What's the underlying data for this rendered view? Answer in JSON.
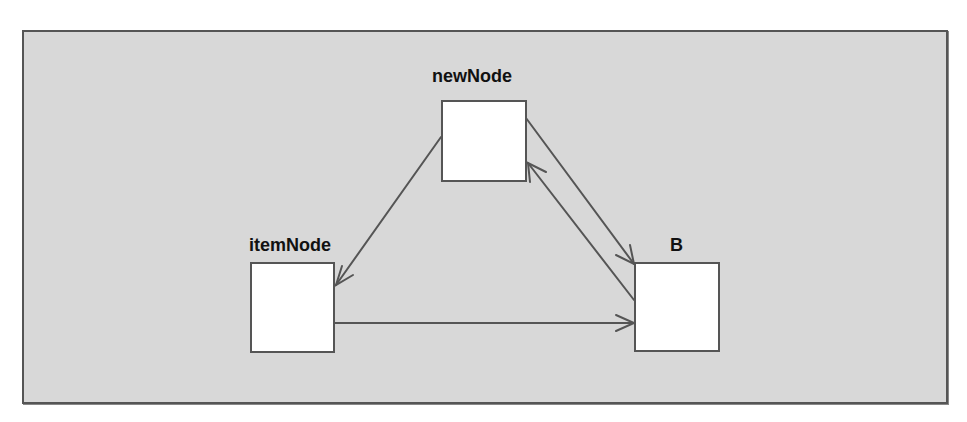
{
  "diagram": {
    "type": "directed-graph",
    "colors": {
      "background": "#d8d8d8",
      "frame": "#555555",
      "node_fill": "#ffffff",
      "node_border": "#555555",
      "edge": "#555555",
      "label": "#111111"
    },
    "nodes": [
      {
        "id": "newNode",
        "label": "newNode"
      },
      {
        "id": "itemNode",
        "label": "itemNode"
      },
      {
        "id": "B",
        "label": "B"
      }
    ],
    "edges": [
      {
        "from": "newNode",
        "to": "itemNode"
      },
      {
        "from": "newNode",
        "to": "B"
      },
      {
        "from": "B",
        "to": "newNode"
      },
      {
        "from": "itemNode",
        "to": "B"
      }
    ]
  }
}
